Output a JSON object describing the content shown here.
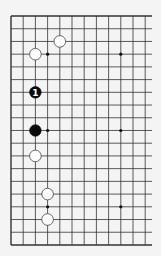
{
  "board": {
    "size": 19,
    "visible_cols": 12,
    "origin_x": 11,
    "origin_y": 16,
    "spacing_x": 12.2,
    "spacing_y": 12.72,
    "right_clip": 152,
    "line_color": "#333333",
    "background": "#f4f4f4",
    "hoshi": [
      [
        3,
        3
      ],
      [
        9,
        3
      ],
      [
        3,
        9
      ],
      [
        9,
        9
      ],
      [
        3,
        15
      ],
      [
        9,
        15
      ]
    ]
  },
  "stones": [
    {
      "color": "white",
      "col": 4,
      "row": 2,
      "label": ""
    },
    {
      "color": "white",
      "col": 2,
      "row": 3,
      "label": ""
    },
    {
      "color": "black",
      "col": 2,
      "row": 6,
      "label": "1"
    },
    {
      "color": "black",
      "col": 2,
      "row": 9,
      "label": ""
    },
    {
      "color": "white",
      "col": 2,
      "row": 11,
      "label": ""
    },
    {
      "color": "white",
      "col": 3,
      "row": 14,
      "label": ""
    },
    {
      "color": "white",
      "col": 3,
      "row": 16,
      "label": ""
    }
  ]
}
